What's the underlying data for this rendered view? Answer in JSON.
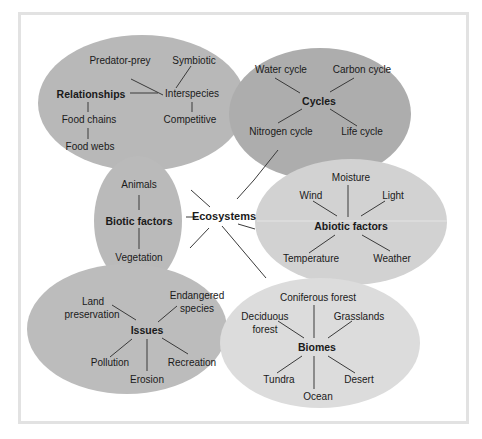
{
  "diagram": {
    "title": "Ecosystems",
    "colors": {
      "frame": "#e2e2e2",
      "dark_ellipse": "#b0b0b0",
      "medium_ellipse": "#bdbdbd",
      "light_ellipse": "#d6d6d6",
      "line": "#3a3a3a",
      "text": "#1a1a1a"
    },
    "clusters": {
      "relationships": {
        "label": "Relationships",
        "items": {
          "predator_prey": "Predator-prey",
          "symbiotic": "Symbiotic",
          "interspecies": "Interspecies",
          "competitive": "Competitive",
          "food_chains": "Food chains",
          "food_webs": "Food webs"
        }
      },
      "cycles": {
        "label": "Cycles",
        "items": {
          "water": "Water cycle",
          "carbon": "Carbon cycle",
          "nitrogen": "Nitrogen cycle",
          "life": "Life cycle"
        }
      },
      "biotic": {
        "label": "Biotic factors",
        "items": {
          "animals": "Animals",
          "vegetation": "Vegetation"
        }
      },
      "abiotic": {
        "label": "Abiotic factors",
        "items": {
          "moisture": "Moisture",
          "wind": "Wind",
          "light": "Light",
          "temperature": "Temperature",
          "weather": "Weather"
        }
      },
      "issues": {
        "label": "Issues",
        "items": {
          "land_1": "Land",
          "land_2": "preservation",
          "endangered_1": "Endangered",
          "endangered_2": "species",
          "pollution": "Pollution",
          "erosion": "Erosion",
          "recreation": "Recreation"
        }
      },
      "biomes": {
        "label": "Biomes",
        "items": {
          "coniferous": "Coniferous forest",
          "deciduous_1": "Deciduous",
          "deciduous_2": "forest",
          "grasslands": "Grasslands",
          "tundra": "Tundra",
          "ocean": "Ocean",
          "desert": "Desert"
        }
      }
    }
  }
}
